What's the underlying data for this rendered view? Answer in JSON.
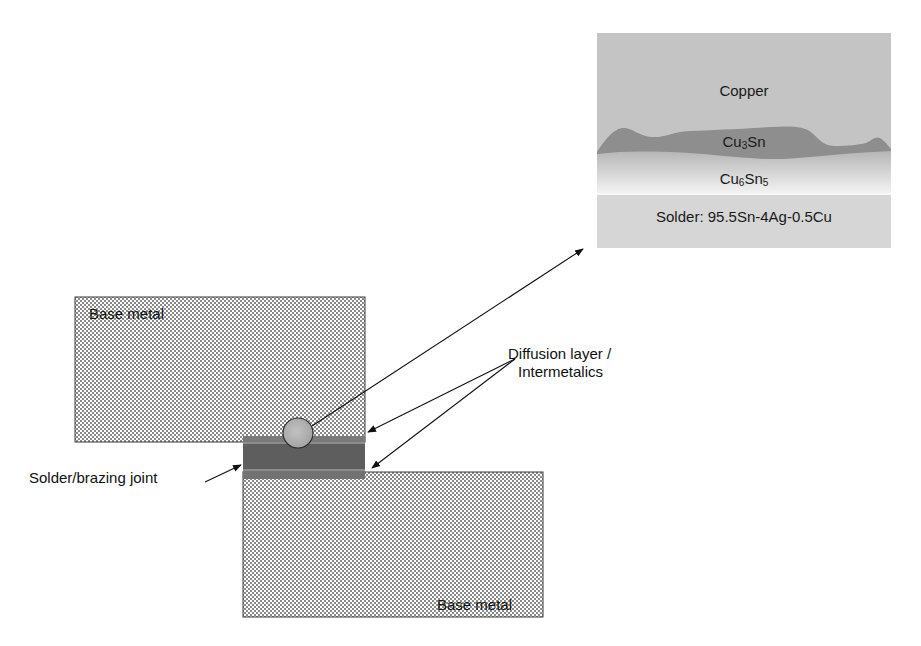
{
  "diagram": {
    "type": "solder joint cross-section schematic",
    "labels": {
      "base_metal_top": "Base metal",
      "base_metal_bottom": "Base metal",
      "joint": "Solder/brazing joint",
      "diffusion_line1": "Diffusion layer /",
      "diffusion_line2": "Intermetalics"
    },
    "inset": {
      "copper": "Copper",
      "cu3sn_base": "Cu",
      "cu3sn_sub1": "3",
      "cu3sn_tail": "Sn",
      "cu6sn5_base": "Cu",
      "cu6sn5_sub1": "6",
      "cu6sn5_mid": "Sn",
      "cu6sn5_sub2": "5",
      "solder": "Solder: 95.5Sn-4Ag-0.5Cu"
    },
    "colors": {
      "background": "#ffffff",
      "hatch_dot": "#8c8c8c",
      "joint_band": "#5e5e5e",
      "joint_strip": "#8a8a8a",
      "copper": "#c4c4c4",
      "cu3sn": "#8e8e8e",
      "cu6sn5_top": "#bdbdbd",
      "cu6sn5_bottom": "#f2f2f2",
      "solder": "#d6d6d6",
      "magnifier": "#b0b0b0"
    }
  }
}
